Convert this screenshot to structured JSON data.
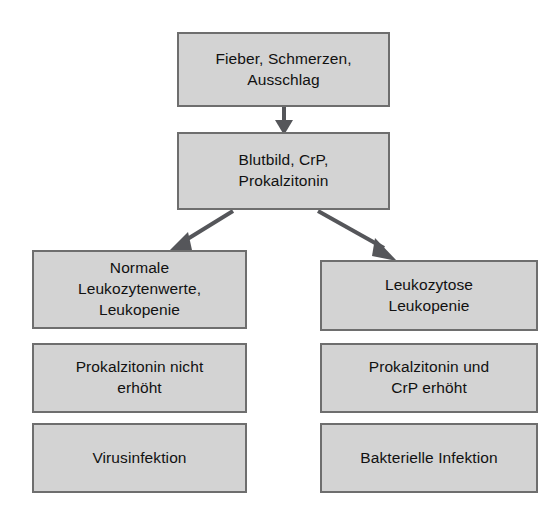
{
  "diagram": {
    "type": "flowchart",
    "orientation": "top-down-branching",
    "colors": {
      "node_fill": "#d3d3d3",
      "node_border": "#6e6e6e",
      "arrow": "#55565a",
      "text": "#111111",
      "background": "#ffffff"
    },
    "nodes": {
      "symptoms": {
        "label": "Fieber, Schmerzen,\nAusschlag",
        "line1": "Fieber, Schmerzen,",
        "line2": "Ausschlag"
      },
      "lab_tests": {
        "label": "Blutbild, CrP,\nProkalzitonin",
        "line1": "Blutbild, CrP,",
        "line2": "Prokalzitonin"
      },
      "left_branch": {
        "finding": {
          "label": "Normale\nLeukozytenwerte,\nLeukopenie",
          "line1": "Normale",
          "line2": "Leukozytenwerte,",
          "line3": "Leukopenie"
        },
        "marker": {
          "label": "Prokalzitonin nicht\nerhöht",
          "line1": "Prokalzitonin nicht",
          "line2": "erhöht"
        },
        "diagnosis": {
          "label": "Virusinfektion"
        }
      },
      "right_branch": {
        "finding": {
          "label": "Leukozytose\nLeukopenie",
          "line1": "Leukozytose",
          "line2": "Leukopenie"
        },
        "marker": {
          "label": "Prokalzitonin und\nCrP erhöht",
          "line1": "Prokalzitonin und",
          "line2": "CrP erhöht"
        },
        "diagnosis": {
          "label": "Bakterielle Infektion"
        }
      }
    },
    "edges": [
      {
        "from": "symptoms",
        "to": "lab_tests",
        "style": "solid-arrow",
        "direction": "down"
      },
      {
        "from": "lab_tests",
        "to": "left_branch.finding",
        "style": "solid-arrow",
        "direction": "down-left"
      },
      {
        "from": "lab_tests",
        "to": "right_branch.finding",
        "style": "solid-arrow",
        "direction": "down-right"
      }
    ]
  }
}
